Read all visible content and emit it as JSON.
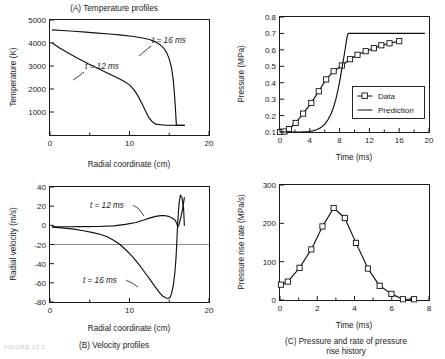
{
  "figure": {
    "panels": [
      "A",
      "B",
      "C",
      "D"
    ],
    "footer_note": "FIGURE 12.2"
  },
  "chart_data": [
    {
      "id": "A",
      "type": "line",
      "title": "(A) Temperature profiles",
      "xlabel": "Radial coordinate (cm)",
      "ylabel": "Temperature (K)",
      "xlim": [
        0,
        20
      ],
      "ylim": [
        0,
        5000
      ],
      "xticks": [
        0,
        10,
        20
      ],
      "xticks_minor": [
        5,
        15
      ],
      "yticks": [
        1000,
        2000,
        3000,
        4000,
        5000
      ],
      "grid": false,
      "legend": "inline-annotations",
      "annotations": [
        {
          "text": "t = 16 ms",
          "x": 16.4,
          "y": 4250
        },
        {
          "text": "t = 12 ms",
          "x": 9.1,
          "y": 2750
        }
      ],
      "series": [
        {
          "name": "t = 16 ms",
          "x": [
            0.3,
            1.5,
            3.0,
            4.5,
            6.0,
            7.5,
            9.0,
            10.5,
            11.5,
            12.5,
            13.2,
            13.8,
            14.3,
            14.7,
            15.0,
            15.3,
            15.5,
            15.65,
            15.78,
            15.85,
            15.9,
            16.9
          ],
          "y": [
            4570,
            4545,
            4510,
            4470,
            4430,
            4390,
            4345,
            4285,
            4230,
            4150,
            4060,
            3940,
            3780,
            3560,
            3300,
            2900,
            2400,
            1800,
            1150,
            700,
            430,
            420
          ]
        },
        {
          "name": "t = 12 ms",
          "x": [
            0.3,
            1.2,
            2.4,
            3.6,
            4.8,
            6.0,
            7.2,
            8.4,
            9.3,
            10.0,
            10.6,
            11.1,
            11.6,
            12.0,
            12.4,
            12.8,
            13.3,
            14.5,
            16.9
          ],
          "y": [
            4000,
            3780,
            3540,
            3320,
            3100,
            2900,
            2700,
            2500,
            2340,
            2180,
            1950,
            1680,
            1350,
            1050,
            780,
            600,
            470,
            425,
            420
          ]
        }
      ]
    },
    {
      "id": "B",
      "type": "line",
      "title": "(B) Velocity profiles",
      "xlabel": "Radial coordinate (cm)",
      "ylabel": "Radial velocity (m/s)",
      "xlim": [
        0,
        20
      ],
      "ylim": [
        -80,
        40
      ],
      "xticks": [
        0,
        10,
        20
      ],
      "xticks_minor": [
        5,
        15
      ],
      "yticks": [
        -80,
        -60,
        -40,
        -20,
        0,
        20,
        40
      ],
      "grid": false,
      "legend": "inline-annotations",
      "annotations": [
        {
          "text": "t = 12 ms",
          "x": 8.4,
          "y": 23
        },
        {
          "text": "t = 16 ms",
          "x": 7.6,
          "y": -57
        }
      ],
      "series": [
        {
          "name": "t = 12 ms",
          "x": [
            0.3,
            2.0,
            4.0,
            6.0,
            8.0,
            9.5,
            10.8,
            11.8,
            12.6,
            13.3,
            13.9,
            14.4,
            14.9,
            15.3,
            15.6,
            15.8,
            15.95,
            16.05,
            16.15,
            16.3,
            16.5,
            16.7,
            16.85,
            16.9
          ],
          "y": [
            -1.5,
            -1.5,
            -1.4,
            -1.2,
            -0.5,
            1.0,
            3.0,
            5.5,
            7.8,
            9.4,
            10.2,
            10.2,
            9.4,
            8.0,
            6.4,
            4.6,
            2.0,
            -1.0,
            -1.0,
            3.0,
            10.0,
            18.0,
            26.0,
            29.0
          ]
        },
        {
          "name": "t = 16 ms",
          "x": [
            0.3,
            1.5,
            3.0,
            4.2,
            5.4,
            6.4,
            7.2,
            8.0,
            8.8,
            9.6,
            10.4,
            11.2,
            12.0,
            12.7,
            13.3,
            13.8,
            14.2,
            14.6,
            14.9,
            15.1,
            15.3,
            15.5,
            15.7,
            15.85,
            15.95,
            16.05,
            16.15,
            16.25,
            16.4,
            16.6,
            16.8,
            16.9
          ],
          "y": [
            -1.8,
            -2.6,
            -4.0,
            -5.6,
            -7.6,
            -9.6,
            -12.0,
            -15.5,
            -20.0,
            -26.0,
            -33.0,
            -41.0,
            -50.0,
            -58.0,
            -65.0,
            -70.5,
            -74.0,
            -75.8,
            -76.2,
            -75.0,
            -71.0,
            -63.0,
            -50.0,
            -34.0,
            -18.0,
            0.0,
            14.0,
            24.0,
            31.5,
            29.0,
            18.0,
            0.0
          ]
        }
      ]
    },
    {
      "id": "C",
      "type": "line",
      "title": "(C) Pressure and rate of pressure",
      "title_line2": "rise history",
      "xlabel": "Time (ms)",
      "ylabel": "Pressure (MPa)",
      "xlim": [
        0,
        20
      ],
      "ylim": [
        0.1,
        0.8
      ],
      "xticks": [
        0,
        4,
        8,
        12,
        16,
        20
      ],
      "xticks_minor": [
        2,
        6,
        10,
        14,
        18
      ],
      "yticks": [
        0.1,
        0.2,
        0.3,
        0.4,
        0.5,
        0.6,
        0.7,
        0.8
      ],
      "ytick_labels": [
        "0.1",
        "0.2",
        "0.3",
        "0.4",
        "0.5",
        "0.6",
        "0.7",
        "0.8"
      ],
      "grid": false,
      "legend": {
        "position": "inside-lower-right",
        "entries": [
          "Data",
          "Prediction"
        ]
      },
      "series": [
        {
          "name": "Data",
          "marker": "square",
          "x": [
            0.0,
            0.6,
            1.2,
            2.1,
            3.1,
            4.2,
            5.2,
            6.2,
            7.2,
            8.3,
            9.4,
            10.4,
            11.5,
            12.6,
            13.6,
            14.7,
            16.0
          ],
          "y": [
            0.1,
            0.103,
            0.118,
            0.155,
            0.212,
            0.277,
            0.348,
            0.42,
            0.47,
            0.505,
            0.543,
            0.57,
            0.592,
            0.61,
            0.628,
            0.64,
            0.653
          ]
        },
        {
          "name": "Prediction",
          "marker": "none",
          "x": [
            0.0,
            1.0,
            2.0,
            3.0,
            3.8,
            4.4,
            5.0,
            5.5,
            6.0,
            6.4,
            6.8,
            7.2,
            7.5,
            7.8,
            8.1,
            8.4,
            8.7,
            8.9,
            9.05,
            9.2,
            12.0,
            16.0,
            19.4
          ],
          "y": [
            0.1,
            0.1,
            0.1,
            0.101,
            0.103,
            0.107,
            0.115,
            0.127,
            0.148,
            0.172,
            0.205,
            0.252,
            0.3,
            0.36,
            0.43,
            0.51,
            0.59,
            0.65,
            0.69,
            0.7,
            0.7,
            0.7,
            0.7
          ]
        }
      ]
    },
    {
      "id": "D",
      "type": "line",
      "xlabel": "Time (ms)",
      "ylabel": "Pressure rise rate (MPa/s)",
      "xlim": [
        0,
        8
      ],
      "ylim": [
        0,
        300
      ],
      "xticks": [
        0,
        2,
        4,
        6,
        8
      ],
      "xticks_minor": [
        1,
        3,
        5,
        7
      ],
      "yticks": [
        0,
        100,
        200,
        300
      ],
      "grid": false,
      "legend": "none",
      "series": [
        {
          "name": "Pressure rise rate",
          "marker": "square",
          "x": [
            0.05,
            0.42,
            1.05,
            1.68,
            2.28,
            2.88,
            3.48,
            4.08,
            4.72,
            5.35,
            5.98,
            6.6,
            7.2
          ],
          "y": [
            40,
            48,
            84,
            132,
            192,
            240,
            214,
            149,
            82,
            37,
            16,
            2,
            2
          ]
        }
      ]
    }
  ]
}
